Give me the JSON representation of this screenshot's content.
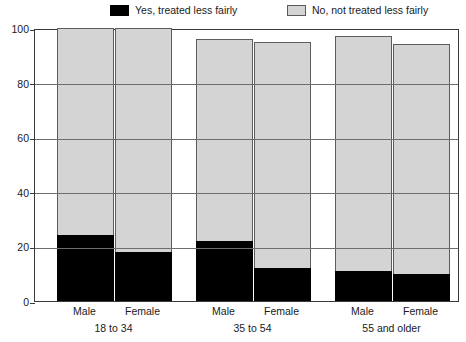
{
  "legend": {
    "items": [
      {
        "label": "Yes, treated less fairly",
        "color": "#000000",
        "name": "legend-yes"
      },
      {
        "label": "No, not treated less fairly",
        "color": "#d4d4d4",
        "name": "legend-no"
      }
    ]
  },
  "axis": {
    "y_ticks": [
      "0",
      "20",
      "40",
      "60",
      "80",
      "100"
    ],
    "y_values": [
      0,
      20,
      40,
      60,
      80,
      100
    ]
  },
  "xlabels": [
    "Male",
    "Female",
    "Male",
    "Female",
    "Male",
    "Female"
  ],
  "group_labels": [
    "18 to 34",
    "35 to 54",
    "55 and older"
  ],
  "chart_data": {
    "type": "bar",
    "title": "",
    "xlabel": "",
    "ylabel": "",
    "ylim": [
      0,
      100
    ],
    "grid": true,
    "legend_position": "top",
    "stacked": true,
    "categories": [
      "Male",
      "Female",
      "Male",
      "Female",
      "Male",
      "Female"
    ],
    "groups": [
      {
        "name": "18 to 34",
        "categories": [
          "Male",
          "Female"
        ]
      },
      {
        "name": "35 to 54",
        "categories": [
          "Male",
          "Female"
        ]
      },
      {
        "name": "55 and older",
        "categories": [
          "Male",
          "Female"
        ]
      }
    ],
    "series": [
      {
        "name": "Yes, treated less fairly",
        "color": "#000000",
        "values": [
          24,
          18,
          22,
          12,
          11,
          10
        ]
      },
      {
        "name": "No, not treated less fairly",
        "color": "#d4d4d4",
        "values": [
          76,
          82,
          74,
          83,
          86,
          84
        ]
      }
    ],
    "bar_totals": [
      100,
      100,
      96,
      95,
      97,
      94
    ]
  }
}
